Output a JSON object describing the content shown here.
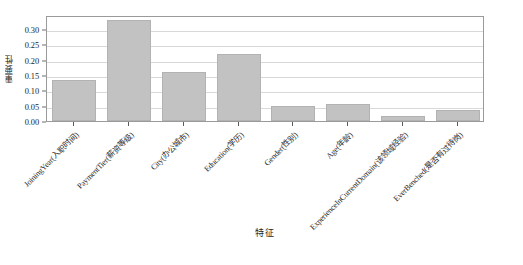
{
  "chart_data": {
    "type": "bar",
    "title": "",
    "xlabel": "特征",
    "ylabel": "重要性",
    "categories": [
      "JoiningYear(入职时间)",
      "PaymentTier(薪资等级)",
      "City(办公城市)",
      "Education(学历)",
      "Gender(性别)",
      "Age(年龄)",
      "ExperienceInCurrentDomain(该领域经验)",
      "EverBenched(是否有过待岗)"
    ],
    "values": [
      0.134,
      0.33,
      0.158,
      0.218,
      0.049,
      0.054,
      0.017,
      0.035
    ],
    "ylim": [
      0.0,
      0.345
    ],
    "yticks": [
      0.0,
      0.05,
      0.1,
      0.15,
      0.2,
      0.25,
      0.3
    ],
    "ytick_labels": [
      "0.00",
      "0.05",
      "0.10",
      "0.15",
      "0.20",
      "0.25",
      "0.30"
    ],
    "grid": true,
    "grid_axis": "y",
    "legend": "none",
    "bar_color": "#c2c2c2",
    "bar_edge_color": "#b2b2b2",
    "axes_color": "#9a9a9a",
    "grid_color": "#d9d9d9",
    "background_color": "#ffffff",
    "bar_width_ratio": 0.8,
    "xtick_rotation": -45
  }
}
